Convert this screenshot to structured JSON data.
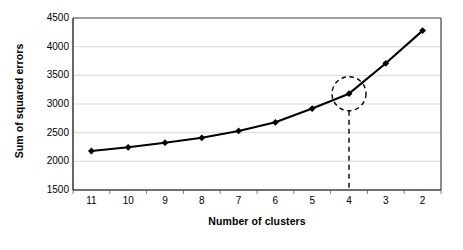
{
  "chart_data": {
    "type": "line",
    "title": "",
    "xlabel": "Number of clusters",
    "ylabel": "Sum of squared errors",
    "categories": [
      "11",
      "10",
      "9",
      "8",
      "7",
      "6",
      "5",
      "4",
      "3",
      "2"
    ],
    "values": [
      2180,
      2245,
      2325,
      2410,
      2530,
      2680,
      2920,
      3180,
      3710,
      4280
    ],
    "series": [
      {
        "name": "Sum of squared errors",
        "values": [
          2180,
          2245,
          2325,
          2410,
          2530,
          2680,
          2920,
          3180,
          3710,
          4280
        ]
      }
    ],
    "ylim": [
      1500,
      4500
    ],
    "yticks": [
      1500,
      2000,
      2500,
      3000,
      3500,
      4000,
      4500
    ],
    "ytick_labels": [
      "1500",
      "2000",
      "2500",
      "3000",
      "3500",
      "4000",
      "4500"
    ],
    "grid": "horizontal",
    "legend": "none",
    "marker": "diamond",
    "line_color": "#000000",
    "marker_color": "#000000",
    "grid_color": "#d9d9d9",
    "axis_color": "#404040",
    "plot_background": "#ffffff",
    "annotations": [
      {
        "kind": "highlight-circle",
        "target_category": "4",
        "target_value": 3180,
        "style": "dashed",
        "note": "elbow point at 4 clusters"
      },
      {
        "kind": "drop-line",
        "target_category": "4",
        "from_value": 3180,
        "to_value": 1500,
        "style": "dashed"
      }
    ]
  }
}
